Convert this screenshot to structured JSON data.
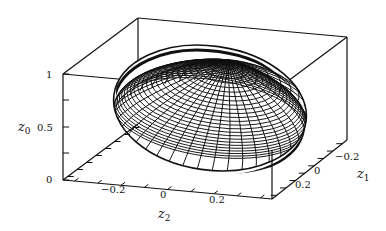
{
  "chart_data": {
    "type": "surface3d",
    "title": "",
    "axes": {
      "z0": {
        "label": "z0",
        "ticks": [
          "0",
          "0.5",
          "1"
        ],
        "range": [
          0,
          1
        ]
      },
      "z1": {
        "label": "z1",
        "ticks": [
          "-0.2",
          "0",
          "0.2"
        ],
        "range": [
          -0.3,
          0.3
        ]
      },
      "z2": {
        "label": "z2",
        "ticks": [
          "-0.2",
          "0",
          "0.2"
        ],
        "range": [
          -0.4,
          0.4
        ]
      }
    },
    "surface": {
      "shape": "ellipsoid",
      "center": {
        "z0": 0.55,
        "z1": 0.0,
        "z2": 0.0
      },
      "semi_axes": {
        "z0": 0.45,
        "z1": 0.2,
        "z2": 0.35
      },
      "style": "black mesh on white"
    },
    "grid": false,
    "legend": null
  },
  "labels": {
    "z0_axis": "z",
    "z0_sub": "0",
    "z1_axis": "z",
    "z1_sub": "1",
    "z2_axis": "z",
    "z2_sub": "2",
    "z0_tick_0": "0",
    "z0_tick_1": "0.5",
    "z0_tick_2": "1",
    "z2_tick_0": "−0.2",
    "z2_tick_1": "0",
    "z2_tick_2": "0.2",
    "z1_tick_0": "−0.2",
    "z1_tick_1": "0",
    "z1_tick_2": "0.2"
  },
  "colors": {
    "line": "#111111",
    "background": "#ffffff"
  }
}
